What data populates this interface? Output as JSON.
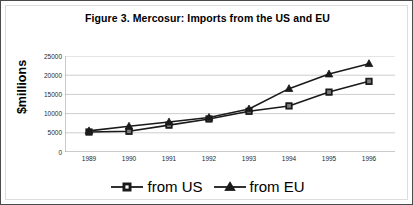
{
  "figure": {
    "title": "Figure 3. Mercosur: Imports from the US and EU",
    "ylabel": "$millions"
  },
  "chart_data": {
    "type": "line",
    "title": "Figure 3. Mercosur: Imports from the US and EU",
    "xlabel": "",
    "ylabel": "$millions",
    "categories": [
      "1989",
      "1990",
      "1991",
      "1992",
      "1993",
      "1994",
      "1995",
      "1996"
    ],
    "x": [
      1989,
      1990,
      1991,
      1992,
      1993,
      1994,
      1995,
      1996
    ],
    "series": [
      {
        "name": "from US",
        "marker": "square",
        "color": "#1a1a1a",
        "values": [
          5200,
          5400,
          7000,
          8600,
          10600,
          12000,
          15600,
          18400
        ]
      },
      {
        "name": "from EU",
        "marker": "triangle",
        "color": "#1a1a1a",
        "values": [
          5500,
          6700,
          7800,
          9000,
          11200,
          16500,
          20300,
          23000
        ]
      }
    ],
    "ylim": [
      0,
      25000
    ],
    "yticks": [
      0,
      5000,
      10000,
      15000,
      20000,
      25000
    ],
    "ytick_labels": [
      "0",
      "5000",
      "10000",
      "15000",
      "20000",
      "25000"
    ],
    "grid": "horizontal",
    "legend_position": "bottom"
  }
}
